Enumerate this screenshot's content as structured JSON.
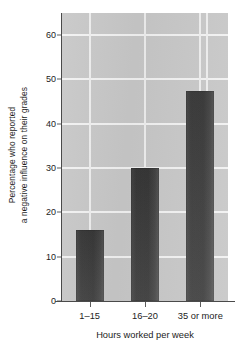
{
  "chart_data": {
    "type": "bar",
    "title": "",
    "subtitle": "",
    "categories": [
      "1–15",
      "16–20",
      "35 or more"
    ],
    "values": [
      16,
      30,
      47.5
    ],
    "xlabel": "Hours worked per week",
    "ylabel_line1": "Percentage who reported",
    "ylabel_line2": "a negative influence on their grades",
    "ylim": [
      0,
      65
    ],
    "yticks": [
      0,
      10,
      20,
      30,
      40,
      50,
      60
    ],
    "ytick_labels": [
      "0",
      "10",
      "20",
      "30",
      "40",
      "50",
      "60"
    ],
    "grid": {
      "horizontal": true,
      "vertical": true,
      "color": "#f2f2f2"
    },
    "legend": {
      "present": false,
      "position": "none"
    },
    "colors": {
      "plot_background": "#c8c8c8",
      "bar_dark": "#3a3a3a",
      "bar_light": "#5a5a5a",
      "axis": "#4a4a4a",
      "text": "#1c1c1c",
      "figure_background": "#ffffff"
    },
    "annotations": []
  }
}
